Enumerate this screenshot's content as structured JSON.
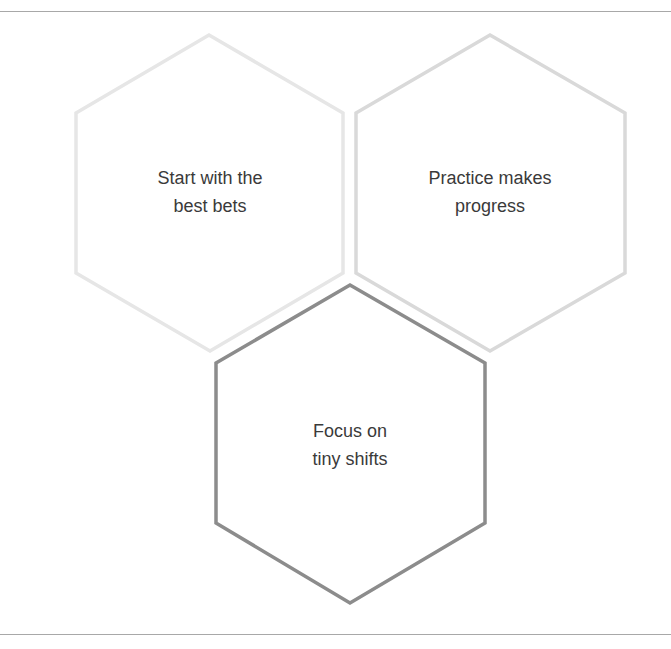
{
  "diagram": {
    "type": "hexagon-cluster",
    "hexagons": [
      {
        "id": "hex-1",
        "lines": [
          "Start with the",
          "best bets"
        ],
        "stroke": "#e6e6e6",
        "points": "209,35 343,113 343,273 210,351 76,273 76,113",
        "label_pos": {
          "left": 110,
          "top": 164
        }
      },
      {
        "id": "hex-2",
        "lines": [
          "Practice makes",
          "progress"
        ],
        "stroke": "#d9d9d9",
        "points": "490,35 625,113 625,273 490,351 356,273 356,113",
        "label_pos": {
          "left": 390,
          "top": 164
        }
      },
      {
        "id": "hex-3",
        "lines": [
          "Focus on",
          "tiny shifts"
        ],
        "stroke": "#8c8c8c",
        "points": "350,285 485,363 485,523 350,603 216,523 216,363",
        "label_pos": {
          "left": 250,
          "top": 417
        }
      }
    ]
  }
}
